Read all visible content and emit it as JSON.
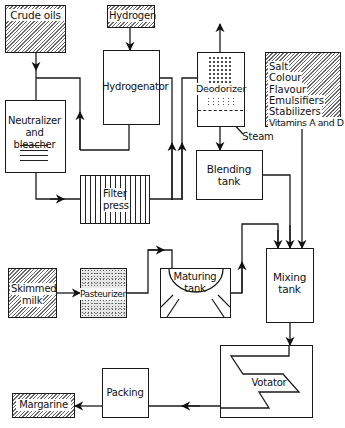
{
  "diagram": {
    "type": "process-flow",
    "nodes": {
      "crude_oils": {
        "label": "Crude oils",
        "style": "hatched"
      },
      "hydrogen": {
        "label": "Hydrogen",
        "style": "hatched"
      },
      "hydrogenator": {
        "label": "Hydrogenator"
      },
      "neutralizer": {
        "line1": "Neutralizer",
        "line2": "and bleacher"
      },
      "filter_press": {
        "line1": "Filter",
        "line2": "press"
      },
      "deodorizer": {
        "label": "Deodorizer",
        "steam_label": "Steam"
      },
      "additives": {
        "style": "hatched",
        "items": [
          "Salt",
          "Colour",
          "Flavour",
          "Emulsifiers",
          "Stabilizers",
          "Vitamins A and D"
        ]
      },
      "blending_tank": {
        "line1": "Blending",
        "line2": "tank"
      },
      "mixing_tank": {
        "line1": "Mixing",
        "line2": "tank"
      },
      "skimmed_milk": {
        "line1": "Skimmed",
        "line2": "milk",
        "style": "hatched"
      },
      "pasteurizer": {
        "label": "Pasteurizer",
        "style": "stippled"
      },
      "maturing_tank": {
        "line1": "Maturing",
        "line2": "tank"
      },
      "votator": {
        "label": "Votator"
      },
      "packing": {
        "label": "Packing"
      },
      "margarine": {
        "label": "Margarine",
        "style": "hatched"
      }
    },
    "edges": [
      {
        "from": "Crude oils",
        "to": "Neutralizer and bleacher"
      },
      {
        "from": "Crude oils",
        "to": "Hydrogenator (bypass line up)"
      },
      {
        "from": "Hydrogen",
        "to": "Hydrogenator"
      },
      {
        "from": "Neutralizer and bleacher",
        "to": "Filter press"
      },
      {
        "from": "Hydrogenator",
        "to": "Filter press"
      },
      {
        "from": "Filter press",
        "to": "Deodorizer"
      },
      {
        "from": "Deodorizer",
        "to": "Blending tank"
      },
      {
        "from": "Blending tank",
        "to": "Mixing tank"
      },
      {
        "from": "Salt / Colour / Flavour / Emulsifiers / Stabilizers / Vitamins A and D",
        "to": "Mixing tank"
      },
      {
        "from": "Skimmed milk",
        "to": "Pasteurizer"
      },
      {
        "from": "Pasteurizer",
        "to": "Maturing tank"
      },
      {
        "from": "Maturing tank",
        "to": "Mixing tank"
      },
      {
        "from": "Mixing tank",
        "to": "Votator"
      },
      {
        "from": "Votator",
        "to": "Packing"
      },
      {
        "from": "Packing",
        "to": "Margarine"
      }
    ]
  }
}
